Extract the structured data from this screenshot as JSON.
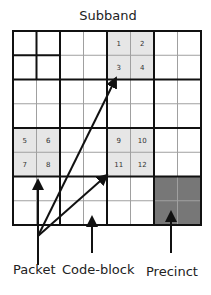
{
  "title": "Subband",
  "grid": {
    "rows": 8,
    "cols": 8,
    "x0": 13,
    "y0": 31,
    "cell_w": 23.5,
    "cell_h": 24.25
  },
  "colors": {
    "light_shade": "#e6e6e6",
    "precinct_shade": "#777777",
    "thin_line": "#999999",
    "thick_line": "#111111"
  },
  "code_block_numbers": [
    {
      "label": "1",
      "row": 0,
      "col": 4
    },
    {
      "label": "2",
      "row": 0,
      "col": 5
    },
    {
      "label": "3",
      "row": 1,
      "col": 4
    },
    {
      "label": "4",
      "row": 1,
      "col": 5
    },
    {
      "label": "5",
      "row": 4,
      "col": 0
    },
    {
      "label": "6",
      "row": 4,
      "col": 1
    },
    {
      "label": "7",
      "row": 5,
      "col": 0
    },
    {
      "label": "8",
      "row": 5,
      "col": 1
    },
    {
      "label": "9",
      "row": 4,
      "col": 4
    },
    {
      "label": "10",
      "row": 4,
      "col": 5
    },
    {
      "label": "11",
      "row": 5,
      "col": 4
    },
    {
      "label": "12",
      "row": 5,
      "col": 5
    }
  ],
  "labels": {
    "packet": "Packet",
    "code_block": "Code-block",
    "precinct": "Precinct"
  }
}
